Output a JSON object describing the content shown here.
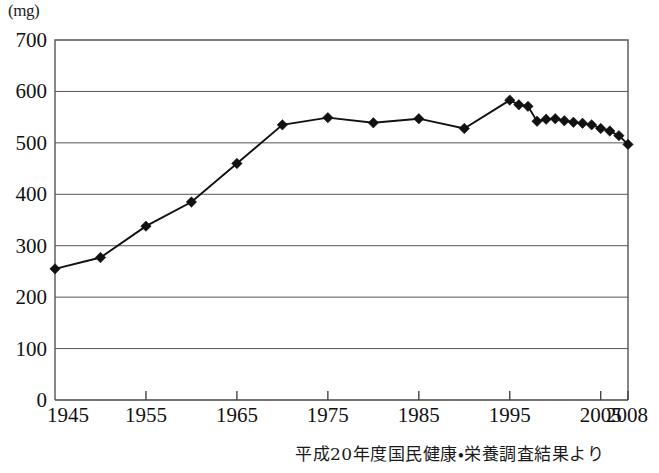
{
  "unit_label": "(mg)",
  "source_note": "平成20年度国民健康・栄養調査結果より",
  "chart_data": {
    "type": "line",
    "title": "",
    "subtitle": "",
    "xlabel": "",
    "ylabel": "(mg)",
    "unit": "mg",
    "grid": true,
    "legend": "none",
    "xlim": [
      1945,
      2008
    ],
    "ylim": [
      0,
      700
    ],
    "ytick_labels": [
      "0",
      "100",
      "200",
      "300",
      "400",
      "500",
      "600",
      "700"
    ],
    "ytick_values": [
      0,
      100,
      200,
      300,
      400,
      500,
      600,
      700
    ],
    "xtick_labels": [
      "1945",
      "1955",
      "1965",
      "1975",
      "1985",
      "1995",
      "2005",
      "2008"
    ],
    "xtick_values": [
      1945,
      1955,
      1965,
      1975,
      1985,
      1995,
      2005,
      2008
    ],
    "series": [
      {
        "name": "カルシウム摂取量",
        "marker": "diamond",
        "color": "#111111",
        "x": [
          1945,
          1950,
          1955,
          1960,
          1965,
          1970,
          1975,
          1980,
          1985,
          1990,
          1995,
          1996,
          1997,
          1998,
          1999,
          2000,
          2001,
          2002,
          2003,
          2004,
          2005,
          2006,
          2007,
          2008
        ],
        "values": [
          255,
          277,
          338,
          385,
          460,
          535,
          549,
          539,
          547,
          528,
          583,
          574,
          571,
          542,
          546,
          547,
          543,
          540,
          538,
          535,
          528,
          523,
          514,
          497
        ]
      }
    ]
  }
}
